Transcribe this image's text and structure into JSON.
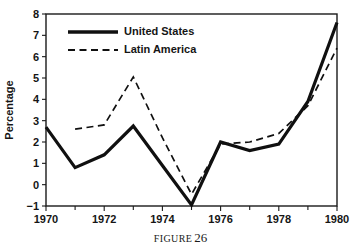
{
  "caption": {
    "word": "FIGURE",
    "number": "26"
  },
  "chart_data": {
    "type": "line",
    "title": "",
    "xlabel": "",
    "ylabel": "Percentage",
    "xlim": [
      1970,
      1980
    ],
    "ylim": [
      -1,
      8
    ],
    "grid": false,
    "legend_position": "top-left",
    "x": [
      1970,
      1971,
      1972,
      1973,
      1974,
      1975,
      1976,
      1977,
      1978,
      1979,
      1980
    ],
    "xtick_labels": [
      "1970",
      "1972",
      "1974",
      "1976",
      "1978",
      "1980"
    ],
    "xtick_values": [
      1970,
      1972,
      1974,
      1976,
      1978,
      1980
    ],
    "xtick_minor_values": [
      1971,
      1973,
      1975,
      1977,
      1979
    ],
    "ytick_labels": [
      "-1",
      "0",
      "1",
      "2",
      "3",
      "4",
      "5",
      "6",
      "7",
      "8"
    ],
    "ytick_values": [
      -1,
      0,
      1,
      2,
      3,
      4,
      5,
      6,
      7,
      8
    ],
    "series": [
      {
        "name": "United States",
        "style": "solid",
        "color": "#101010",
        "x": [
          1970,
          1971,
          1972,
          1973,
          1974,
          1975,
          1976,
          1977,
          1978,
          1979,
          1980
        ],
        "values": [
          2.7,
          0.8,
          1.4,
          2.75,
          0.9,
          -0.95,
          2.0,
          1.6,
          1.9,
          3.9,
          7.6
        ]
      },
      {
        "name": "Latin America",
        "style": "dashed",
        "color": "#101010",
        "x": [
          1971,
          1972,
          1973,
          1974,
          1975,
          1976,
          1977,
          1978,
          1979,
          1980
        ],
        "values": [
          2.6,
          2.8,
          5.05,
          2.2,
          -0.45,
          1.9,
          2.0,
          2.4,
          3.7,
          6.4
        ]
      }
    ]
  }
}
